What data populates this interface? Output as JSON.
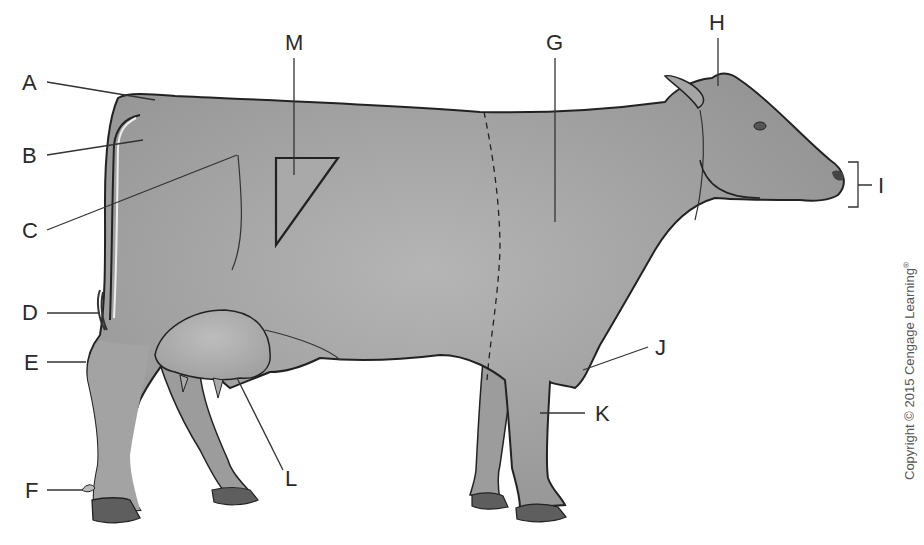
{
  "figure": {
    "labels": [
      {
        "id": "A",
        "letter": "A"
      },
      {
        "id": "B",
        "letter": "B"
      },
      {
        "id": "C",
        "letter": "C"
      },
      {
        "id": "D",
        "letter": "D"
      },
      {
        "id": "E",
        "letter": "E"
      },
      {
        "id": "F",
        "letter": "F"
      },
      {
        "id": "G",
        "letter": "G"
      },
      {
        "id": "H",
        "letter": "H"
      },
      {
        "id": "I",
        "letter": "I"
      },
      {
        "id": "J",
        "letter": "J"
      },
      {
        "id": "K",
        "letter": "K"
      },
      {
        "id": "L",
        "letter": "L"
      },
      {
        "id": "M",
        "letter": "M"
      }
    ],
    "copyright": "Copyright © 2015 Cengage Learning",
    "copyright_mark": "®",
    "colors": {
      "body": "#9a9a9a",
      "body_highlight": "#b8b8b8",
      "hoof": "#5e5e5e",
      "outline": "#222222",
      "leader": "#333333"
    }
  }
}
